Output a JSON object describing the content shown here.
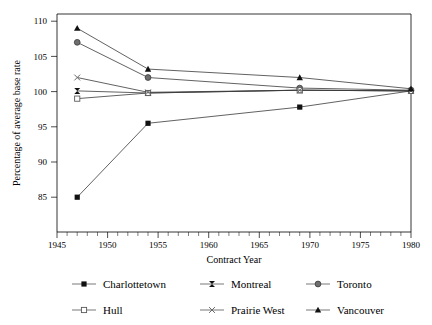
{
  "chart_data": {
    "type": "line",
    "title": "",
    "xlabel": "Contract Year",
    "ylabel": "Percentage of average base rate",
    "xlim": [
      1945,
      1980
    ],
    "ylim": [
      85,
      110
    ],
    "xticks": [
      1945,
      1950,
      1955,
      1960,
      1965,
      1970,
      1975,
      1980
    ],
    "yticks": [
      85,
      90,
      95,
      100,
      105,
      110
    ],
    "grid": false,
    "legend_position": "bottom",
    "x": [
      1947,
      1954,
      1969,
      1980
    ],
    "series": [
      {
        "name": "Charlottetown",
        "marker": "filled-square",
        "values": [
          85.0,
          95.5,
          97.8,
          100.1
        ]
      },
      {
        "name": "Montreal",
        "marker": "bowtie-x",
        "values": [
          100.1,
          99.8,
          100.2,
          100.1
        ]
      },
      {
        "name": "Toronto",
        "marker": "filled-circle",
        "values": [
          107.0,
          102.0,
          100.5,
          100.2
        ]
      },
      {
        "name": "Hull",
        "marker": "open-square",
        "values": [
          99.0,
          99.8,
          100.2,
          100.1
        ]
      },
      {
        "name": "Prairie West",
        "marker": "x-cross",
        "values": [
          102.0,
          99.9,
          100.2,
          100.1
        ]
      },
      {
        "name": "Vancouver",
        "marker": "filled-triangle",
        "values": [
          109.0,
          103.2,
          102.0,
          100.4
        ]
      }
    ]
  },
  "legend": {
    "rows": [
      [
        {
          "label": "Charlottetown",
          "marker": "filled-square"
        },
        {
          "label": "Montreal",
          "marker": "bowtie-x"
        },
        {
          "label": "Toronto",
          "marker": "filled-circle"
        }
      ],
      [
        {
          "label": "Hull",
          "marker": "open-square"
        },
        {
          "label": "Prairie West",
          "marker": "x-cross"
        },
        {
          "label": "Vancouver",
          "marker": "filled-triangle"
        }
      ]
    ]
  },
  "colors": {
    "axis": "#000000",
    "line": "#3a3a3a",
    "marker_dark": "#111111",
    "marker_gray": "#6e6e6e",
    "marker_open": "#ffffff",
    "background": "#ffffff"
  }
}
